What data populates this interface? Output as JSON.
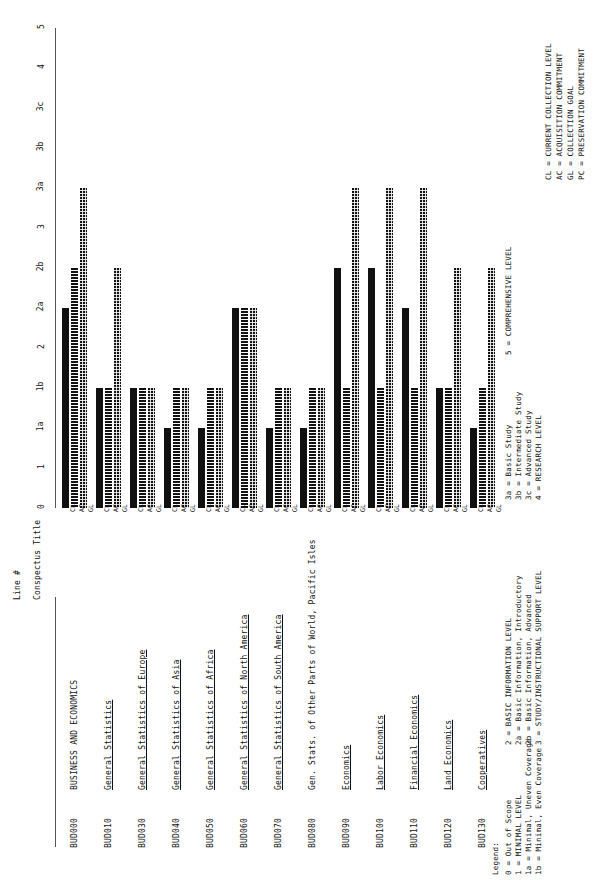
{
  "headers": {
    "line_no": "Line #",
    "conspectus_title": "Conspectus Title"
  },
  "axis": {
    "ticks": [
      "0",
      "1",
      "1a",
      "1b",
      "2",
      "2a",
      "2b",
      "3",
      "3a",
      "3b",
      "3c",
      "4",
      "5"
    ]
  },
  "series_labels": [
    "CL",
    "AC",
    "GL"
  ],
  "legend": {
    "label": "Legend:",
    "col1": [
      "0  = Out of Scope",
      "1  = MINIMAL LEVEL",
      "1a = Minimal, Uneven Coverage",
      "1b = Minimal, Even Coverage"
    ],
    "col2": [
      "2  = BASIC INFORMATION LEVEL",
      "2a = Basic Information, Introductory",
      "2b = Basic Information, Advanced",
      "3  = STUDY/INSTRUCTIONAL SUPPORT LEVEL"
    ],
    "col3": [
      "3a = Basic Study",
      "3b = Intermediate Study",
      "3c = Advanced Study",
      "4  = RESEARCH LEVEL"
    ],
    "col4": [
      "5  = COMPREHENSIVE LEVEL"
    ],
    "col5": [
      "CL = CURRENT COLLECTION LEVEL",
      "AC = ACQUISITION COMMITMENT",
      "GL = COLLECTION GOAL",
      "PC = PRESERVATION COMMITMENT"
    ]
  },
  "chart_data": {
    "type": "bar",
    "title": "",
    "xlabel": "Conspectus Title",
    "ylabel": "Collection Level",
    "orientation": "vertical-rotated-90ccw",
    "ylim": [
      0,
      12
    ],
    "grid": false,
    "legend_position": "bottom",
    "tick_labels": [
      "0",
      "1",
      "1a",
      "1b",
      "2",
      "2a",
      "2b",
      "3",
      "3a",
      "3b",
      "3c",
      "4",
      "5"
    ],
    "tick_values": [
      0,
      1,
      2,
      3,
      4,
      5,
      6,
      7,
      8,
      9,
      10,
      11,
      12
    ],
    "series": [
      {
        "name": "CL",
        "label": "CURRENT COLLECTION LEVEL",
        "pattern": "solid"
      },
      {
        "name": "AC",
        "label": "ACQUISITION COMMITMENT",
        "pattern": "dotted"
      },
      {
        "name": "GL",
        "label": "COLLECTION GOAL",
        "pattern": "hatch"
      }
    ],
    "categories": [
      {
        "line": "BUD000",
        "title": "BUSINESS AND ECONOMICS",
        "underline": false,
        "CL": "2a",
        "AC": "2b",
        "GL": "3a",
        "CL_v": 5,
        "AC_v": 6,
        "GL_v": 8
      },
      {
        "line": "BUD010",
        "title": "General Statistics",
        "underline": true,
        "CL": "1b",
        "AC": "1b",
        "GL": "2b",
        "CL_v": 3,
        "AC_v": 3,
        "GL_v": 6
      },
      {
        "line": "BUD030",
        "title": "General Statistics of Europe",
        "underline": true,
        "CL": "1b",
        "AC": "1b",
        "GL": "1b",
        "CL_v": 3,
        "AC_v": 3,
        "GL_v": 3
      },
      {
        "line": "BUD040",
        "title": "General Statistics of Asia",
        "underline": true,
        "CL": "1a",
        "AC": "1b",
        "GL": "1b",
        "CL_v": 2,
        "AC_v": 3,
        "GL_v": 3
      },
      {
        "line": "BUD050",
        "title": "General Statistics of Africa",
        "underline": true,
        "CL": "1a",
        "AC": "1b",
        "GL": "1b",
        "CL_v": 2,
        "AC_v": 3,
        "GL_v": 3
      },
      {
        "line": "BUD060",
        "title": "General Statistics of North America",
        "underline": true,
        "CL": "2a",
        "AC": "2a",
        "GL": "2a",
        "CL_v": 5,
        "AC_v": 5,
        "GL_v": 5
      },
      {
        "line": "BUD070",
        "title": "General Statistics of South America",
        "underline": true,
        "CL": "1a",
        "AC": "1b",
        "GL": "1b",
        "CL_v": 2,
        "AC_v": 3,
        "GL_v": 3
      },
      {
        "line": "BUD080",
        "title": "Gen. Stats. of Other Parts of World, Pacific Isles",
        "underline": false,
        "CL": "1a",
        "AC": "1b",
        "GL": "1b",
        "CL_v": 2,
        "AC_v": 3,
        "GL_v": 3
      },
      {
        "line": "BUD090",
        "title": "Economics",
        "underline": true,
        "CL": "2b",
        "AC": "1b",
        "GL": "3a",
        "CL_v": 6,
        "AC_v": 3,
        "GL_v": 8
      },
      {
        "line": "BUD100",
        "title": "Labor Economics",
        "underline": true,
        "CL": "2b",
        "AC": "1b",
        "GL": "3a",
        "CL_v": 6,
        "AC_v": 3,
        "GL_v": 8
      },
      {
        "line": "BUD110",
        "title": "Financial Economics",
        "underline": true,
        "CL": "2a",
        "AC": "1b",
        "GL": "3a",
        "CL_v": 5,
        "AC_v": 3,
        "GL_v": 8
      },
      {
        "line": "BUD120",
        "title": "Land Economics",
        "underline": true,
        "CL": "1b",
        "AC": "1b",
        "GL": "2b",
        "CL_v": 3,
        "AC_v": 3,
        "GL_v": 6
      },
      {
        "line": "BUD130",
        "title": "Cooperatives",
        "underline": true,
        "CL": "1a",
        "AC": "1b",
        "GL": "2b",
        "CL_v": 2,
        "AC_v": 3,
        "GL_v": 6
      }
    ]
  }
}
